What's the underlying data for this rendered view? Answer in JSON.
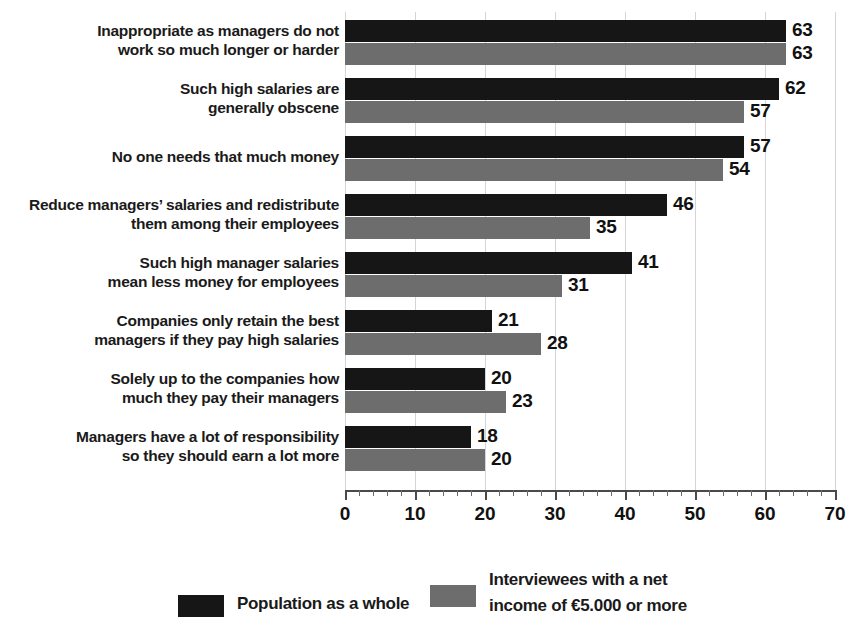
{
  "chart_data": {
    "type": "bar",
    "orientation": "horizontal",
    "title": "",
    "xlabel": "",
    "ylabel": "",
    "xlim": [
      0,
      70
    ],
    "xticks": [
      0,
      10,
      20,
      30,
      40,
      50,
      60,
      70
    ],
    "minor_tick_step": 2,
    "grid": true,
    "grid_axis": "x",
    "legend_position": "bottom",
    "categories": [
      "Inappropriate as managers do not\nwork so much longer or harder",
      "Such high salaries are\ngenerally obscene",
      "No one needs that much money",
      "Reduce managers’ salaries and redistribute\nthem among their employees",
      "Such high manager salaries\nmean less money for employees",
      "Companies only retain the best\nmanagers if they pay high salaries",
      "Solely up to the companies how\nmuch they pay their managers",
      "Managers have a lot of responsibility\nso they should earn a lot more"
    ],
    "series": [
      {
        "name": "Population as a whole",
        "color": "#161616",
        "values": [
          63,
          62,
          57,
          46,
          41,
          21,
          20,
          18
        ]
      },
      {
        "name": "Interviewees with a net\nincome of €5.000 or more",
        "color": "#6d6d6d",
        "values": [
          63,
          57,
          54,
          35,
          31,
          28,
          23,
          20
        ]
      }
    ]
  },
  "axis": {
    "tick_labels": [
      "0",
      "10",
      "20",
      "30",
      "40",
      "50",
      "60",
      "70"
    ]
  },
  "legend": {
    "items": [
      {
        "label": "Population as a whole",
        "color": "#161616"
      },
      {
        "label": "Interviewees with a net\nincome of €5.000 or more",
        "color": "#6d6d6d"
      }
    ]
  },
  "colors": {
    "series_a": "#161616",
    "series_b": "#6d6d6d",
    "gridline": "#d4d4d4",
    "axis": "#4a4a4a",
    "text": "#1a1a1a",
    "background": "#ffffff"
  },
  "title_sliver": ""
}
